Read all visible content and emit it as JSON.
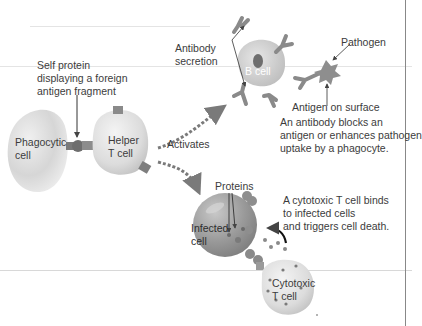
{
  "diagram": {
    "type": "immune-response-illustration",
    "labels": {
      "self_protein": [
        "Self protein",
        "displaying a foreign",
        "antigen fragment"
      ],
      "phagocytic_cell": [
        "Phagocytic",
        "cell"
      ],
      "helper_t_cell": [
        "Helper",
        "T cell"
      ],
      "activates": "Activates",
      "antibody_secretion": [
        "Antibody",
        "secretion"
      ],
      "b_cell": "B cell",
      "pathogen": "Pathogen",
      "antigen_on_surface": "Antigen on surface",
      "antibody_note": [
        "An antibody blocks an",
        "antigen or enhances pathogen",
        "uptake by a phagocyte."
      ],
      "proteins": "Proteins",
      "infected_cell": [
        "Infected",
        "cell"
      ],
      "cytotoxic_note": [
        "A cytotoxic T cell binds",
        "to infected cells",
        "and triggers cell death."
      ],
      "cytotoxic_t_cell": [
        "Cytotoxic",
        "T cell"
      ]
    },
    "colors": {
      "cell_light": "#d9d9d9",
      "cell_mid": "#bdbdbd",
      "cell_dark": "#8c8c8c",
      "antibody": "#8a8a8a",
      "arrow_dots": "#7a7a7a",
      "border": "#888888"
    }
  }
}
